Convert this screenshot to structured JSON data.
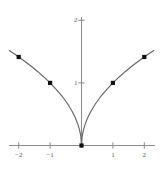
{
  "chart_data": {
    "type": "line",
    "title": "",
    "subtitle": "",
    "xlabel": "",
    "ylabel": "",
    "xlim": [
      -2.3,
      2.35
    ],
    "ylim": [
      -0.12,
      2.05
    ],
    "grid": false,
    "legend": null,
    "axis_color": "#8c8c8c",
    "curve_color": "#666666",
    "marker_color": "#111111",
    "tick_label_color": "#5a5a5a",
    "background": "#ffffff",
    "xticks": [
      {
        "value": -2,
        "label": "−2"
      },
      {
        "value": -1,
        "label": "−1"
      },
      {
        "value": 1,
        "label": "1"
      },
      {
        "value": 2,
        "label": "2"
      }
    ],
    "yticks": [
      {
        "value": 1,
        "label": "1"
      },
      {
        "value": 2,
        "label": "2"
      }
    ],
    "series": [
      {
        "name": "y = sqrt(|x|)",
        "style": "line",
        "x": [
          -2.3,
          -2.1,
          -2.0,
          -1.8,
          -1.6,
          -1.4,
          -1.2,
          -1.0,
          -0.8,
          -0.6,
          -0.45,
          -0.3,
          -0.2,
          -0.12,
          -0.06,
          -0.02,
          0.0,
          0.02,
          0.06,
          0.12,
          0.2,
          0.3,
          0.45,
          0.6,
          0.8,
          1.0,
          1.2,
          1.4,
          1.6,
          1.8,
          2.0,
          2.1,
          2.3
        ],
        "y": [
          1.517,
          1.449,
          1.414,
          1.342,
          1.265,
          1.183,
          1.095,
          1.0,
          0.894,
          0.775,
          0.671,
          0.548,
          0.447,
          0.346,
          0.245,
          0.141,
          0.0,
          0.141,
          0.245,
          0.346,
          0.447,
          0.548,
          0.671,
          0.775,
          0.894,
          1.0,
          1.095,
          1.183,
          1.265,
          1.342,
          1.414,
          1.449,
          1.517
        ]
      }
    ],
    "markers": [
      {
        "x": -2,
        "y": 1.414,
        "label": "point-at-x-minus-2"
      },
      {
        "x": -1,
        "y": 1.0,
        "label": "point-at-x-minus-1"
      },
      {
        "x": 0,
        "y": 0.0,
        "label": "point-at-origin"
      },
      {
        "x": 1,
        "y": 1.0,
        "label": "point-at-x-1"
      },
      {
        "x": 2,
        "y": 1.414,
        "label": "point-at-x-2"
      }
    ]
  }
}
